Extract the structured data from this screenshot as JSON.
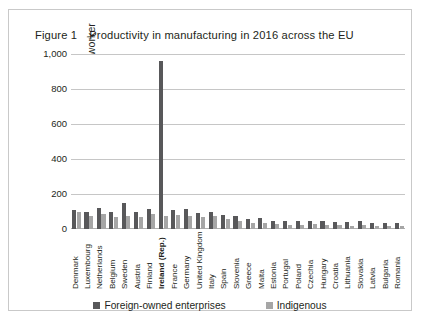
{
  "figure": {
    "number": "Figure 1",
    "caption": "Productivity in manufacturing in 2016 across the EU"
  },
  "legend": {
    "position": "bottom-center",
    "items": [
      {
        "label": "Foreign-owned enterprises",
        "color": "#58585a"
      },
      {
        "label": "Indigenous",
        "color": "#a6a6a6"
      }
    ]
  },
  "highlight_category": "Ireland (Rep.)",
  "chart_data": {
    "type": "bar",
    "title": "Productivity in manufacturing in 2016 across the EU",
    "xlabel": "",
    "ylabel": "thousands of € per worker",
    "ylim": [
      0,
      1000
    ],
    "yticks": [
      "0",
      "200",
      "400",
      "600",
      "800",
      "1,000"
    ],
    "ytick_values": [
      0,
      200,
      400,
      600,
      800,
      1000
    ],
    "grid": true,
    "grouped": true,
    "categories": [
      "Denmark",
      "Luxembourg",
      "Netherlands",
      "Belgium",
      "Sweden",
      "Austria",
      "Finland",
      "Ireland (Rep.)",
      "France",
      "Germany",
      "United Kingdom",
      "Italy",
      "Spain",
      "Slovenia",
      "Greece",
      "Malta",
      "Estonia",
      "Portugal",
      "Poland",
      "Czechia",
      "Hungary",
      "Croatia",
      "Lithuania",
      "Slovakia",
      "Latvia",
      "Bulgaria",
      "Romania"
    ],
    "series": [
      {
        "name": "Foreign-owned enterprises",
        "color": "#58585a",
        "values": [
          110,
          98,
          122,
          98,
          148,
          98,
          112,
          960,
          106,
          116,
          92,
          98,
          80,
          72,
          60,
          64,
          46,
          48,
          44,
          46,
          46,
          40,
          40,
          44,
          36,
          34,
          34
        ]
      },
      {
        "name": "Indigenous",
        "color": "#a6a6a6",
        "values": [
          96,
          74,
          86,
          68,
          76,
          66,
          84,
          72,
          80,
          74,
          66,
          72,
          56,
          44,
          34,
          36,
          28,
          24,
          22,
          26,
          22,
          22,
          20,
          24,
          18,
          16,
          16
        ]
      }
    ]
  }
}
